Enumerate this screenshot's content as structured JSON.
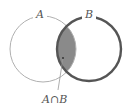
{
  "diagram": {
    "type": "venn",
    "sets": [
      {
        "label": "A",
        "stroke": "#b0b0b0",
        "stroke_width": 1
      },
      {
        "label": "B",
        "stroke": "#555555",
        "stroke_width": 2.4
      }
    ],
    "intersection": {
      "label": "A∩B",
      "fill": "#8a8a8a"
    }
  }
}
